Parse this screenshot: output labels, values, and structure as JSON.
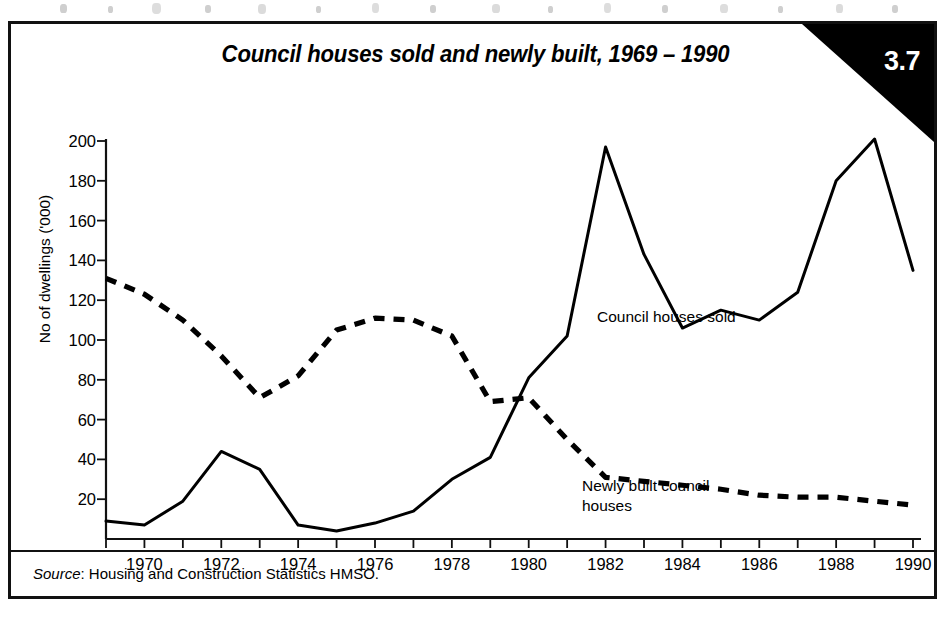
{
  "figure": {
    "title": "Council houses sold and newly built, 1969 – 1990",
    "corner_badge": "3.7",
    "source_prefix": "Source",
    "source_text": ": Housing and Construction Statistics HMSO."
  },
  "chart_data": {
    "type": "line",
    "title": "Council houses sold and newly built, 1969 – 1990",
    "xlabel": "",
    "ylabel": "No of dwellings ('000)",
    "xlim": [
      1969,
      1990
    ],
    "ylim": [
      0,
      200
    ],
    "grid": false,
    "legend_position": "inline-annotations",
    "x": [
      1969,
      1970,
      1971,
      1972,
      1973,
      1974,
      1975,
      1976,
      1977,
      1978,
      1979,
      1980,
      1981,
      1982,
      1983,
      1984,
      1985,
      1986,
      1987,
      1988,
      1989,
      1990
    ],
    "xticks": [
      1969,
      1970,
      1971,
      1972,
      1973,
      1974,
      1975,
      1976,
      1977,
      1978,
      1979,
      1980,
      1981,
      1982,
      1983,
      1984,
      1985,
      1986,
      1987,
      1988,
      1989,
      1990
    ],
    "xtick_labels": [
      "",
      "1970",
      "",
      "1972",
      "",
      "1974",
      "",
      "1976",
      "",
      "1978",
      "",
      "1980",
      "",
      "1982",
      "",
      "1984",
      "",
      "1986",
      "",
      "1988",
      "",
      "1990"
    ],
    "yticks": [
      20,
      40,
      60,
      80,
      100,
      120,
      140,
      160,
      180,
      200
    ],
    "ytick_labels": [
      "20",
      "40",
      "60",
      "80",
      "100",
      "120",
      "140",
      "160",
      "180",
      "200"
    ],
    "series": [
      {
        "name": "Council houses sold",
        "style": "solid",
        "color": "#000000",
        "annotation": "Council houses sold",
        "values": [
          9,
          7,
          19,
          44,
          35,
          7,
          4,
          8,
          14,
          30,
          41,
          81,
          102,
          197,
          143,
          106,
          115,
          110,
          124,
          180,
          201,
          135
        ]
      },
      {
        "name": "Newly built council houses",
        "style": "dashed",
        "color": "#000000",
        "annotation": "Newly built council\nhouses",
        "values": [
          131,
          123,
          110,
          92,
          71,
          82,
          105,
          111,
          110,
          102,
          69,
          71,
          50,
          31,
          29,
          27,
          25,
          22,
          21,
          21,
          19,
          17
        ]
      }
    ]
  },
  "annotations": {
    "sold_label": "Council houses sold",
    "built_label": "Newly built council\nhouses"
  }
}
